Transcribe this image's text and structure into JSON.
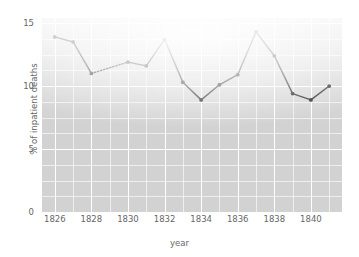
{
  "chart_data": {
    "type": "line",
    "title": "",
    "xlabel": "year",
    "ylabel": "% of inpatient deaths",
    "xlim": [
      1825.3,
      1841.7
    ],
    "ylim": [
      0,
      15.4
    ],
    "xticks": [
      1826,
      1828,
      1830,
      1832,
      1834,
      1836,
      1838,
      1840
    ],
    "xtick_labels": [
      "1826",
      "1828",
      "1830",
      "1832",
      "1834",
      "1836",
      "1838",
      "1840"
    ],
    "yticks": [
      0,
      5,
      10,
      15
    ],
    "ytick_labels": [
      "0",
      "5",
      "10",
      "15"
    ],
    "grid": true,
    "grid_major_y": [
      0,
      5,
      10,
      15
    ],
    "grid_minor_y": [
      1.25,
      2.5,
      3.75,
      6.25,
      7.5,
      8.75,
      11.25,
      12.5,
      13.75
    ],
    "grid_major_x": [
      1826,
      1828,
      1830,
      1832,
      1834,
      1836,
      1838,
      1840
    ],
    "grid_minor_x": [
      1827,
      1829,
      1831,
      1833,
      1835,
      1837,
      1839,
      1841
    ],
    "legend": null,
    "x": [
      1826,
      1827,
      1828,
      1830,
      1831,
      1832,
      1833,
      1834,
      1835,
      1836,
      1837,
      1838,
      1839,
      1840,
      1841
    ],
    "values": [
      13.9,
      13.5,
      11.0,
      11.9,
      11.6,
      13.7,
      10.3,
      8.9,
      10.1,
      10.9,
      14.3,
      12.4,
      9.4,
      8.9,
      10.0
    ],
    "series": [
      {
        "name": "% of inpatient deaths",
        "x": [
          1826,
          1827,
          1828,
          1830,
          1831,
          1832,
          1833,
          1834,
          1835,
          1836,
          1837,
          1838,
          1839,
          1840,
          1841
        ],
        "values": [
          13.9,
          13.5,
          11.0,
          11.9,
          11.6,
          13.7,
          10.3,
          8.9,
          10.1,
          10.9,
          14.3,
          12.4,
          9.4,
          8.9,
          10.0
        ],
        "color": "#181818",
        "marker": "circle",
        "gap_segments": [
          [
            1828,
            1830
          ]
        ],
        "gap_style": "dotted",
        "note": "1829 value missing; segment 1828-1830 drawn dotted"
      }
    ],
    "panel_color": "#d2d2d2",
    "grid_color": "#ffffff"
  }
}
